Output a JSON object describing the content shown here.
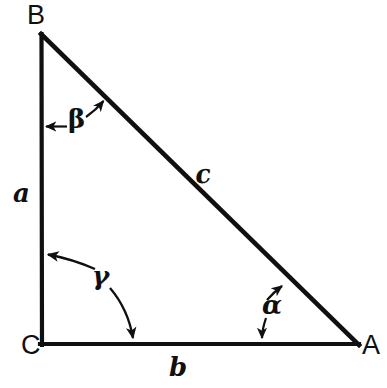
{
  "figure": {
    "type": "geometry-diagram",
    "stroke_color": "#101010",
    "background_color": "#ffffff",
    "vertices": [
      {
        "name": "B",
        "label": "B",
        "x": 41,
        "y": 34
      },
      {
        "name": "C",
        "label": "C",
        "x": 42,
        "y": 344
      },
      {
        "name": "A",
        "label": "A",
        "x": 358,
        "y": 344
      }
    ],
    "sides": [
      {
        "name": "a",
        "label": "a",
        "from": "B",
        "to": "C",
        "label_x": 22,
        "label_y": 192
      },
      {
        "name": "b",
        "label": "b",
        "from": "C",
        "to": "A",
        "label_x": 180,
        "label_y": 367
      },
      {
        "name": "c",
        "label": "c",
        "from": "B",
        "to": "A",
        "label_x": 204,
        "label_y": 174
      }
    ],
    "angles": [
      {
        "name": "alpha",
        "label": "α",
        "at_vertex": "A",
        "label_x": 272,
        "label_y": 306
      },
      {
        "name": "beta",
        "label": "β",
        "at_vertex": "B",
        "label_x": 76,
        "label_y": 120
      },
      {
        "name": "gamma",
        "label": "γ",
        "at_vertex": "C",
        "label_x": 102,
        "label_y": 277
      }
    ]
  }
}
